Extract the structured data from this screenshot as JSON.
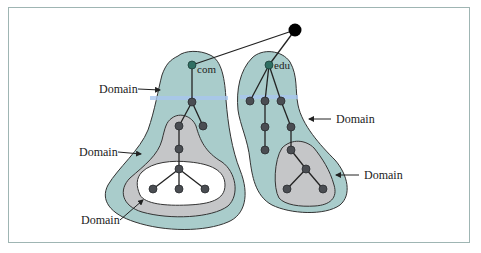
{
  "figure": {
    "type": "dns-domain-tree-diagram",
    "colors": {
      "outer_domain_fill": "#a9cccb",
      "inner_domain_fill": "#c5c6c8",
      "innermost_domain_fill": "#ffffff",
      "highlight_band": "#a8c6ee",
      "root_node": "#000000",
      "tld_node": "#2f6f63",
      "node": "#4a4d52",
      "edge": "#222222"
    },
    "nodes": {
      "com_label": "com",
      "edu_label": "edu"
    },
    "labels": [
      {
        "id": "com-outer",
        "text": "Domain"
      },
      {
        "id": "com-middle",
        "text": "Domain"
      },
      {
        "id": "com-inner",
        "text": "Domain"
      },
      {
        "id": "edu-outer",
        "text": "Domain"
      },
      {
        "id": "edu-inner",
        "text": "Domain"
      }
    ]
  }
}
